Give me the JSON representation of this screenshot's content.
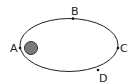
{
  "diagram": {
    "type": "elliptical-orbit",
    "colors": {
      "orbit": "#222222",
      "body_fill": "#7a7a7a",
      "body_stroke": "#333333",
      "label": "#222222"
    },
    "points": [
      {
        "label": "A",
        "position": "perihelion-left"
      },
      {
        "label": "B",
        "position": "top"
      },
      {
        "label": "C",
        "position": "aphelion-right"
      },
      {
        "label": "D",
        "position": "bottom-right"
      }
    ]
  }
}
